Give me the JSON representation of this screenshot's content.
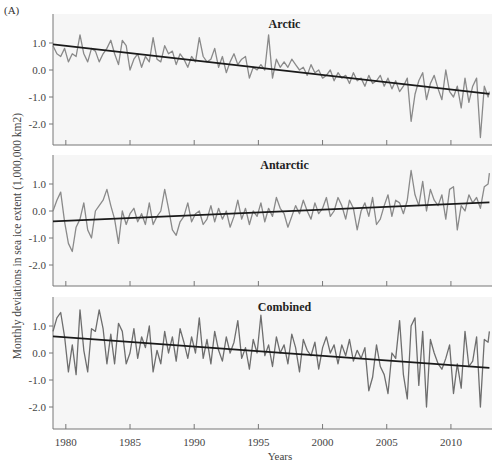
{
  "figure_label": "(A)",
  "ylabel": "Monthly deviations in sea ice extent (1,000,000 km2)",
  "xlabel": "Years",
  "colors": {
    "series": "#8a8a8a",
    "trend": "#1a1a1a",
    "panel_bg": "#f6f6f6",
    "axis": "#777777"
  },
  "chart_data": [
    {
      "type": "line",
      "title": "Arctic",
      "xlabel": "Years",
      "ylabel": "Monthly deviations in sea ice extent (1,000,000 km2)",
      "xlim": [
        1979,
        2013
      ],
      "ylim": [
        -2.8,
        1.6
      ],
      "xticks": [
        1980,
        1985,
        1990,
        1995,
        2000,
        2005,
        2010
      ],
      "yticks": [
        1.0,
        0.0,
        -1.0,
        -2.0
      ],
      "ytick_labels": [
        "1.0",
        "0.0",
        "-1.0",
        "-2.0"
      ],
      "grid": false,
      "series": [
        {
          "name": "Monthly deviation",
          "x": [
            1979,
            1979.3,
            1979.6,
            1979.9,
            1980.2,
            1980.5,
            1980.8,
            1981.1,
            1981.4,
            1981.7,
            1982,
            1982.3,
            1982.6,
            1982.9,
            1983.2,
            1983.5,
            1983.8,
            1984.1,
            1984.4,
            1984.7,
            1985,
            1985.3,
            1985.6,
            1985.9,
            1986.2,
            1986.5,
            1986.8,
            1987.1,
            1987.4,
            1987.7,
            1988,
            1988.3,
            1988.6,
            1988.9,
            1989.2,
            1989.5,
            1989.8,
            1990.1,
            1990.4,
            1990.7,
            1991,
            1991.3,
            1991.6,
            1991.9,
            1992.2,
            1992.5,
            1992.8,
            1993.1,
            1993.4,
            1993.7,
            1994,
            1994.3,
            1994.6,
            1994.9,
            1995.2,
            1995.5,
            1995.8,
            1996.1,
            1996.4,
            1996.7,
            1997,
            1997.3,
            1997.6,
            1997.9,
            1998.2,
            1998.5,
            1998.8,
            1999.1,
            1999.4,
            1999.7,
            2000,
            2000.3,
            2000.6,
            2000.9,
            2001.2,
            2001.5,
            2001.8,
            2002.1,
            2002.4,
            2002.7,
            2003,
            2003.3,
            2003.6,
            2003.9,
            2004.2,
            2004.5,
            2004.8,
            2005.1,
            2005.4,
            2005.7,
            2006,
            2006.3,
            2006.6,
            2006.9,
            2007.2,
            2007.5,
            2007.8,
            2008.1,
            2008.4,
            2008.7,
            2009,
            2009.3,
            2009.6,
            2009.9,
            2010.2,
            2010.5,
            2010.8,
            2011.1,
            2011.4,
            2011.7,
            2012,
            2012.3,
            2012.6,
            2012.9,
            2013
          ],
          "y": [
            0.9,
            0.6,
            0.5,
            0.8,
            0.3,
            0.6,
            0.5,
            1.3,
            0.6,
            0.3,
            0.8,
            0.7,
            0.3,
            0.6,
            0.8,
            1.1,
            0.6,
            0.2,
            1.1,
            0.9,
            0.0,
            0.4,
            0.6,
            0.1,
            0.5,
            0.3,
            1.2,
            0.4,
            0.3,
            0.9,
            0.6,
            0.7,
            0.2,
            0.6,
            0.4,
            0.1,
            0.5,
            0.3,
            1.2,
            0.5,
            0.3,
            0.4,
            0.8,
            0.1,
            0.5,
            -0.1,
            0.3,
            0.6,
            0.2,
            0.4,
            0.5,
            -0.3,
            0.1,
            0.0,
            0.2,
            0.0,
            1.3,
            -0.3,
            0.4,
            0.1,
            0.3,
            0.1,
            0.4,
            0.2,
            0.0,
            0.1,
            -0.2,
            0.2,
            -0.1,
            0.0,
            -0.3,
            -0.2,
            0.0,
            -0.4,
            -0.1,
            -0.3,
            -0.2,
            -0.5,
            -0.1,
            -0.4,
            -0.3,
            -0.6,
            -0.2,
            -0.5,
            -0.4,
            -0.2,
            -0.6,
            -0.3,
            -0.7,
            -0.4,
            -0.8,
            -0.6,
            -0.3,
            -1.9,
            -0.9,
            -0.4,
            -0.1,
            -1.1,
            -0.5,
            -0.2,
            -0.7,
            -1.1,
            0.0,
            -0.8,
            -1.0,
            -0.6,
            -1.4,
            -0.3,
            -1.2,
            -0.6,
            -0.3,
            -2.5,
            -0.6,
            -1.0,
            -0.8
          ],
          "color": "#8a8a8a"
        },
        {
          "name": "Trend",
          "x": [
            1979,
            2013
          ],
          "y": [
            0.95,
            -0.88
          ],
          "color": "#1a1a1a"
        }
      ]
    },
    {
      "type": "line",
      "title": "Antarctic",
      "xlim": [
        1979,
        2013
      ],
      "ylim": [
        -2.8,
        1.6
      ],
      "xticks": [
        1980,
        1985,
        1990,
        1995,
        2000,
        2005,
        2010
      ],
      "yticks": [
        1.0,
        0.0,
        -1.0,
        -2.0
      ],
      "ytick_labels": [
        "1.0",
        "0.0",
        "-1.0",
        "-2.0"
      ],
      "series": [
        {
          "name": "Monthly deviation",
          "x": [
            1979,
            1979.3,
            1979.6,
            1979.9,
            1980.2,
            1980.5,
            1980.8,
            1981.1,
            1981.4,
            1981.7,
            1982,
            1982.3,
            1982.6,
            1982.9,
            1983.2,
            1983.5,
            1983.8,
            1984.1,
            1984.4,
            1984.7,
            1985,
            1985.3,
            1985.6,
            1985.9,
            1986.2,
            1986.5,
            1986.8,
            1987.1,
            1987.4,
            1987.7,
            1988,
            1988.3,
            1988.6,
            1988.9,
            1989.2,
            1989.5,
            1989.8,
            1990.1,
            1990.4,
            1990.7,
            1991,
            1991.3,
            1991.6,
            1991.9,
            1992.2,
            1992.5,
            1992.8,
            1993.1,
            1993.4,
            1993.7,
            1994,
            1994.3,
            1994.6,
            1994.9,
            1995.2,
            1995.5,
            1995.8,
            1996.1,
            1996.4,
            1996.7,
            1997,
            1997.3,
            1997.6,
            1997.9,
            1998.2,
            1998.5,
            1998.8,
            1999.1,
            1999.4,
            1999.7,
            2000,
            2000.3,
            2000.6,
            2000.9,
            2001.2,
            2001.5,
            2001.8,
            2002.1,
            2002.4,
            2002.7,
            2003,
            2003.3,
            2003.6,
            2003.9,
            2004.2,
            2004.5,
            2004.8,
            2005.1,
            2005.4,
            2005.7,
            2006,
            2006.3,
            2006.6,
            2006.9,
            2007.2,
            2007.5,
            2007.8,
            2008.1,
            2008.4,
            2008.7,
            2009,
            2009.3,
            2009.6,
            2009.9,
            2010.2,
            2010.5,
            2010.8,
            2011.1,
            2011.4,
            2011.7,
            2012,
            2012.3,
            2012.6,
            2012.9,
            2013
          ],
          "y": [
            0.0,
            0.4,
            0.7,
            -0.4,
            -1.2,
            -1.5,
            -0.6,
            -0.3,
            0.3,
            -0.7,
            -1.0,
            0.0,
            0.2,
            0.4,
            0.8,
            0.2,
            -0.3,
            -1.2,
            0.0,
            -0.5,
            -0.1,
            0.1,
            -0.4,
            -0.1,
            -0.5,
            0.3,
            -0.5,
            -0.2,
            0.0,
            0.8,
            0.1,
            -0.7,
            -0.9,
            -0.4,
            -0.2,
            0.3,
            -0.4,
            -0.1,
            0.0,
            -0.5,
            -0.3,
            0.2,
            -0.4,
            0.1,
            -0.3,
            0.0,
            -0.6,
            -0.2,
            0.4,
            -0.3,
            0.1,
            -0.5,
            0.0,
            -0.2,
            0.3,
            -0.4,
            0.1,
            -0.2,
            0.5,
            0.1,
            -0.1,
            -0.6,
            -0.2,
            0.2,
            -0.1,
            0.4,
            0.0,
            -0.3,
            0.3,
            -0.1,
            0.1,
            0.5,
            -0.2,
            0.0,
            0.5,
            0.2,
            -0.3,
            0.4,
            0.1,
            -0.7,
            0.0,
            0.3,
            -0.2,
            0.5,
            -0.5,
            -0.3,
            0.2,
            0.6,
            -0.2,
            0.4,
            0.3,
            -0.1,
            0.4,
            1.5,
            0.6,
            0.2,
            1.1,
            0.0,
            0.8,
            0.4,
            0.2,
            0.6,
            -0.3,
            0.8,
            0.9,
            -0.7,
            0.2,
            0.0,
            0.6,
            0.3,
            0.5,
            0.1,
            0.9,
            1.0,
            1.4
          ],
          "color": "#8a8a8a"
        },
        {
          "name": "Trend",
          "x": [
            1979,
            2013
          ],
          "y": [
            -0.38,
            0.32
          ],
          "color": "#1a1a1a"
        }
      ]
    },
    {
      "type": "line",
      "title": "Combined",
      "xlim": [
        1979,
        2013
      ],
      "ylim": [
        -2.8,
        1.6
      ],
      "xticks": [
        1980,
        1985,
        1990,
        1995,
        2000,
        2005,
        2010
      ],
      "xtick_labels": [
        "1980",
        "1985",
        "1990",
        "1995",
        "2000",
        "2005",
        "2010"
      ],
      "yticks": [
        1.0,
        0.0,
        -1.0,
        -2.0
      ],
      "ytick_labels": [
        "1.0",
        "0.0",
        "-1.0",
        "-2.0"
      ],
      "series": [
        {
          "name": "Monthly deviation",
          "x": [
            1979,
            1979.3,
            1979.6,
            1979.9,
            1980.2,
            1980.5,
            1980.8,
            1981.1,
            1981.4,
            1981.7,
            1982,
            1982.3,
            1982.6,
            1982.9,
            1983.2,
            1983.5,
            1983.8,
            1984.1,
            1984.4,
            1984.7,
            1985,
            1985.3,
            1985.6,
            1985.9,
            1986.2,
            1986.5,
            1986.8,
            1987.1,
            1987.4,
            1987.7,
            1988,
            1988.3,
            1988.6,
            1988.9,
            1989.2,
            1989.5,
            1989.8,
            1990.1,
            1990.4,
            1990.7,
            1991,
            1991.3,
            1991.6,
            1991.9,
            1992.2,
            1992.5,
            1992.8,
            1993.1,
            1993.4,
            1993.7,
            1994,
            1994.3,
            1994.6,
            1994.9,
            1995.2,
            1995.5,
            1995.8,
            1996.1,
            1996.4,
            1996.7,
            1997,
            1997.3,
            1997.6,
            1997.9,
            1998.2,
            1998.5,
            1998.8,
            1999.1,
            1999.4,
            1999.7,
            2000,
            2000.3,
            2000.6,
            2000.9,
            2001.2,
            2001.5,
            2001.8,
            2002.1,
            2002.4,
            2002.7,
            2003,
            2003.3,
            2003.6,
            2003.9,
            2004.2,
            2004.5,
            2004.8,
            2005.1,
            2005.4,
            2005.7,
            2006,
            2006.3,
            2006.6,
            2006.9,
            2007.2,
            2007.5,
            2007.8,
            2008.1,
            2008.4,
            2008.7,
            2009,
            2009.3,
            2009.6,
            2009.9,
            2010.2,
            2010.5,
            2010.8,
            2011.1,
            2011.4,
            2011.7,
            2012,
            2012.3,
            2012.6,
            2012.9,
            2013
          ],
          "y": [
            0.8,
            1.3,
            1.5,
            0.6,
            -0.7,
            0.3,
            -0.8,
            1.6,
            0.1,
            -0.7,
            0.9,
            0.8,
            1.6,
            0.9,
            -0.4,
            0.7,
            -0.4,
            1.1,
            0.8,
            -0.4,
            0.0,
            0.9,
            -0.2,
            0.6,
            0.2,
            1.0,
            -0.7,
            0.1,
            -0.4,
            0.8,
            0.0,
            0.6,
            -0.3,
            0.9,
            0.4,
            -0.2,
            0.6,
            0.0,
            1.3,
            -0.2,
            0.5,
            -0.4,
            0.8,
            0.1,
            -0.3,
            0.6,
            0.0,
            0.4,
            1.2,
            -0.2,
            0.2,
            -0.6,
            0.5,
            0.0,
            1.4,
            -0.1,
            0.3,
            -0.5,
            0.6,
            0.0,
            0.3,
            -0.4,
            0.7,
            0.2,
            -0.7,
            0.5,
            0.1,
            -0.1,
            0.4,
            -0.6,
            0.2,
            0.6,
            0.0,
            0.3,
            -0.4,
            0.3,
            -0.1,
            0.5,
            -0.3,
            0.1,
            -0.2,
            0.2,
            -1.4,
            -0.9,
            0.3,
            -0.5,
            -0.8,
            -1.5,
            0.0,
            -0.2,
            1.2,
            -0.8,
            -1.7,
            1.0,
            1.3,
            -1.2,
            0.8,
            -2.0,
            0.5,
            0.0,
            -0.4,
            -0.6,
            -0.2,
            0.3,
            -1.5,
            -0.4,
            -1.3,
            0.8,
            -0.5,
            -0.3,
            0.6,
            -2.0,
            0.5,
            0.4,
            0.8
          ],
          "color": "#6e6e6e"
        },
        {
          "name": "Trend",
          "x": [
            1979,
            2013
          ],
          "y": [
            0.62,
            -0.55
          ],
          "color": "#1a1a1a"
        }
      ]
    }
  ]
}
